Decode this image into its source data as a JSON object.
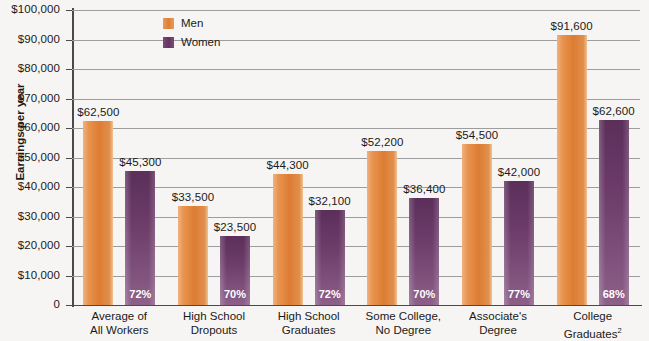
{
  "chart_data": {
    "type": "bar",
    "title": "",
    "xlabel": "",
    "ylabel": "Earnings per year",
    "ylim": [
      0,
      100000
    ],
    "grid": true,
    "legend_position": "top-center",
    "categories": [
      "Average of All Workers",
      "High School Dropouts",
      "High School Graduates",
      "Some College, No Degree",
      "Associate's Degree",
      "College Graduates"
    ],
    "series": [
      {
        "name": "Men",
        "values": [
          62500,
          33500,
          44300,
          52200,
          54500,
          91600
        ]
      },
      {
        "name": "Women",
        "values": [
          45300,
          23500,
          32100,
          36400,
          42000,
          62600
        ]
      }
    ],
    "value_labels": {
      "men": [
        "$62,500",
        "$33,500",
        "$44,300",
        "$52,200",
        "$54,500",
        "$91,600"
      ],
      "women": [
        "$45,300",
        "$23,500",
        "$32,100",
        "$36,400",
        "$42,000",
        "$62,600"
      ]
    },
    "ratio_labels": [
      "72%",
      "70%",
      "72%",
      "70%",
      "77%",
      "68%"
    ],
    "ytick_labels": [
      "$100,000",
      "$90,000",
      "$80,000",
      "$70,000",
      "$60,000",
      "$50,000",
      "$40,000",
      "$30,000",
      "$20,000",
      "$10,000",
      "0"
    ],
    "ytick_values": [
      100000,
      90000,
      80000,
      70000,
      60000,
      50000,
      40000,
      30000,
      20000,
      10000,
      0
    ],
    "colors": {
      "men": "#dd7c33",
      "women": "#6b3a68",
      "grid": "#9d9d9d",
      "axis": "#4a4a4a",
      "background": "#f6f5f3"
    }
  },
  "category_label_lines": [
    [
      "Average of",
      "All Workers"
    ],
    [
      "High School",
      "Dropouts"
    ],
    [
      "High School",
      "Graduates"
    ],
    [
      "Some College,",
      "No Degree"
    ],
    [
      "Associate's",
      "Degree"
    ],
    [
      "College",
      "Graduates"
    ]
  ],
  "category_label_superscripts": [
    "",
    "",
    "",
    "",
    "",
    "2"
  ],
  "legend": {
    "items": [
      {
        "label": "Men"
      },
      {
        "label": "Women"
      }
    ]
  }
}
